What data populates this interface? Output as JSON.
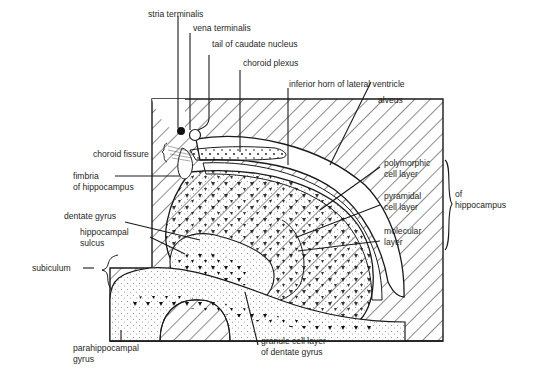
{
  "labels": {
    "stria_terminalis": "stria terminalis",
    "vena_terminalis": "vena terminalis",
    "tail_caudate": "tail of caudate nucleus",
    "choroid_plexus": "choroid plexus",
    "inferior_horn": "inferior horn of lateral ventricle",
    "alveus": "alveus",
    "choroid_fissure": "choroid fissure",
    "fimbria_1": "fimbria",
    "fimbria_2": "of hippocampus",
    "polymorphic_1": "polymorphic",
    "polymorphic_2": "cell layer",
    "pyramidal_1": "pyramidal",
    "pyramidal_2": "cell layer",
    "molecular_1": "molecular",
    "molecular_2": "layer",
    "of_hippo_1": "of",
    "of_hippo_2": "hippocampus",
    "dentate_gyrus": "dentate gyrus",
    "hippo_sulcus_1": "hippocampal",
    "hippo_sulcus_2": "sulcus",
    "subiculum": "subiculum",
    "parahippo_1": "parahippocampal",
    "parahippo_2": "gyrus",
    "granule_1": "granule cell layer",
    "granule_2": "of dentate gyrus"
  },
  "colors": {
    "ink": "#1a1a1a",
    "background": "#ffffff"
  }
}
